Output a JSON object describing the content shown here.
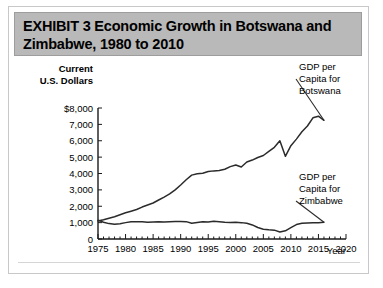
{
  "exhibit": {
    "title": "EXHIBIT 3  Economic Growth in Botswana and\nZimbabwe, 1980 to 2010"
  },
  "chart_data": {
    "type": "line",
    "title": "Economic Growth in Botswana and Zimbabwe, 1980 to 2010",
    "xlabel": "Year",
    "ylabel": "Current U.S. Dollars",
    "ylabel_line1": "Current",
    "ylabel_line2": "U.S. Dollars",
    "xlim": [
      1975,
      2020
    ],
    "ylim": [
      0,
      8000
    ],
    "grid": false,
    "legend_position": "right-inline",
    "ytick_labels": [
      "$8,000",
      "7,000",
      "6,000",
      "5,000",
      "4,000",
      "3,000",
      "2,000",
      "1,000",
      "0"
    ],
    "ytick_values": [
      8000,
      7000,
      6000,
      5000,
      4000,
      3000,
      2000,
      1000,
      0
    ],
    "xtick_labels": [
      "1975",
      "1980",
      "1985",
      "1990",
      "1995",
      "2000",
      "2005",
      "2010",
      "2015",
      "2020"
    ],
    "xtick_values": [
      1975,
      1980,
      1985,
      1990,
      1995,
      2000,
      2005,
      2010,
      2015,
      2020
    ],
    "x": [
      1975,
      1976,
      1977,
      1978,
      1979,
      1980,
      1981,
      1982,
      1983,
      1984,
      1985,
      1986,
      1987,
      1988,
      1989,
      1990,
      1991,
      1992,
      1993,
      1994,
      1995,
      1996,
      1997,
      1998,
      1999,
      2000,
      2001,
      2002,
      2003,
      2004,
      2005,
      2006,
      2007,
      2008,
      2009,
      2010,
      2011,
      2012,
      2013,
      2014,
      2015,
      2016
    ],
    "series": [
      {
        "name": "GDP per Capita for Botswana",
        "label_line1": "GDP per",
        "label_line2": "Capita for",
        "label_line3": "Botswana",
        "values": [
          1100,
          1180,
          1270,
          1360,
          1480,
          1600,
          1700,
          1800,
          1950,
          2080,
          2200,
          2380,
          2560,
          2750,
          3000,
          3300,
          3620,
          3900,
          3980,
          4020,
          4120,
          4160,
          4180,
          4260,
          4420,
          4520,
          4400,
          4700,
          4820,
          4980,
          5100,
          5350,
          5600,
          6000,
          5050,
          5700,
          6100,
          6550,
          6900,
          7400,
          7500,
          7250
        ]
      },
      {
        "name": "GDP per Capita for Zimbabwe",
        "label_line1": "GDP per",
        "label_line2": "Capita for",
        "label_line3": "Zimbabwe",
        "values": [
          1150,
          1020,
          940,
          900,
          930,
          1000,
          1050,
          1060,
          1050,
          1020,
          1040,
          1050,
          1040,
          1060,
          1070,
          1070,
          1060,
          960,
          1010,
          1060,
          1040,
          1090,
          1060,
          1020,
          1010,
          1020,
          1000,
          960,
          860,
          700,
          600,
          560,
          540,
          430,
          500,
          700,
          880,
          960,
          980,
          990,
          1000,
          1020
        ]
      }
    ]
  }
}
